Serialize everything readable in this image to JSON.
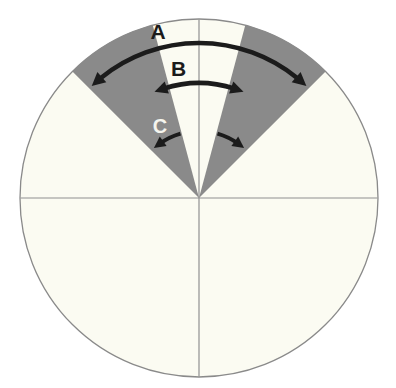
{
  "page": {
    "background": "#ffffff"
  },
  "labels": {
    "outer_arc": "A",
    "inner_arc": "B",
    "rotation_arrow": "C"
  },
  "colors": {
    "circle_fill": "#fbfbf2",
    "wedge_fill": "#8a8a8a",
    "circle_outline": "#8a8a8a",
    "axis_line": "#909090",
    "arrow": "#1b1b1b",
    "label_dark": "#1b1b1b",
    "label_light": "#f5f5ee"
  },
  "diagram": {
    "type": "sector-angle-diagram",
    "circle": {
      "cx": 199,
      "cy": 198,
      "r": 179
    },
    "quadrant_lines": [
      "horizontal-diameter",
      "vertical-diameter"
    ],
    "shaded_sectors_deg_from_vertical": {
      "left": [
        15,
        45
      ],
      "right": [
        15,
        45
      ]
    },
    "arc_arrows": [
      {
        "label": "A",
        "radius": 155,
        "half_span_deg_from_vertical": 41,
        "heads": 2
      },
      {
        "label": "B",
        "radius": 115,
        "half_span_deg_from_vertical": 22,
        "heads": 2
      }
    ],
    "rotation_arrows": [
      {
        "label": "C",
        "side": "left",
        "direction": "counterclockwise"
      },
      {
        "label": "",
        "side": "right",
        "direction": "clockwise"
      }
    ]
  }
}
